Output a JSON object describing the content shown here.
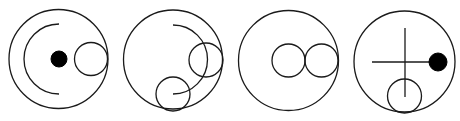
{
  "diagram": {
    "title": "",
    "panels": [
      {
        "id": "panel-1",
        "outer_circle": {
          "cx": 58.5,
          "cy": 59,
          "r": 49.5
        },
        "elements": [
          {
            "type": "arc",
            "cx": 59,
            "cy": 59,
            "r": 35,
            "from": "top",
            "to": "bottom",
            "side": "left"
          },
          {
            "type": "filled-dot",
            "cx": 59,
            "cy": 59,
            "r": 8
          },
          {
            "type": "small-circle",
            "cx": 91,
            "cy": 59,
            "r": 16.5
          }
        ]
      },
      {
        "id": "panel-2",
        "outer_circle": {
          "cx": 173,
          "cy": 59.5,
          "r": 49.5
        },
        "elements": [
          {
            "type": "arc",
            "cx": 173,
            "cy": 59.5,
            "r": 34.5,
            "from": "top",
            "to": "bottom",
            "side": "right"
          },
          {
            "type": "small-circle",
            "cx": 206,
            "cy": 60,
            "r": 17
          },
          {
            "type": "small-circle",
            "cx": 173,
            "cy": 94,
            "r": 17
          }
        ]
      },
      {
        "id": "panel-3",
        "outer_circle": {
          "cx": 288.5,
          "cy": 60.5,
          "r": 50
        },
        "elements": [
          {
            "type": "small-circle",
            "cx": 288.5,
            "cy": 60.5,
            "r": 16.5
          },
          {
            "type": "small-circle",
            "cx": 321.5,
            "cy": 60.5,
            "r": 16.5
          }
        ]
      },
      {
        "id": "panel-4",
        "outer_circle": {
          "cx": 404.5,
          "cy": 61.5,
          "r": 50.5
        },
        "elements": [
          {
            "type": "line",
            "x1": 405,
            "y1": 28,
            "x2": 405,
            "y2": 97,
            "orientation": "vertical"
          },
          {
            "type": "line",
            "x1": 372,
            "y1": 62,
            "x2": 432,
            "y2": 62,
            "orientation": "horizontal"
          },
          {
            "type": "filled-dot",
            "cx": 438,
            "cy": 62,
            "r": 9
          },
          {
            "type": "small-circle",
            "cx": 404.5,
            "cy": 96,
            "r": 17
          }
        ]
      }
    ]
  },
  "colors": {
    "stroke": "#1a1a1a",
    "fill_dot": "#000000",
    "background": "#ffffff"
  }
}
